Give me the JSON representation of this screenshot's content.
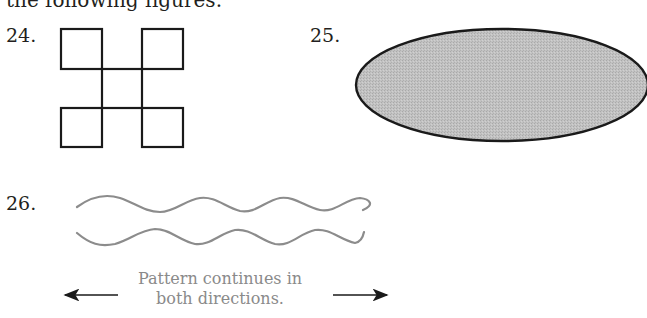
{
  "intro_text": "the following figures.",
  "problems": [
    {
      "number": "24.",
      "figure": "four-squares-cross"
    },
    {
      "number": "25.",
      "figure": "shaded-ellipse"
    },
    {
      "number": "26.",
      "figure": "two-wavy-lines"
    }
  ],
  "caption": {
    "line1": "Pattern continues in",
    "line2": "both directions."
  },
  "colors": {
    "stroke": "#1a1a1a",
    "ellipse_fill": "#bdbdbd",
    "wave": "#8c8c8c",
    "caption": "#8a8a8a"
  }
}
